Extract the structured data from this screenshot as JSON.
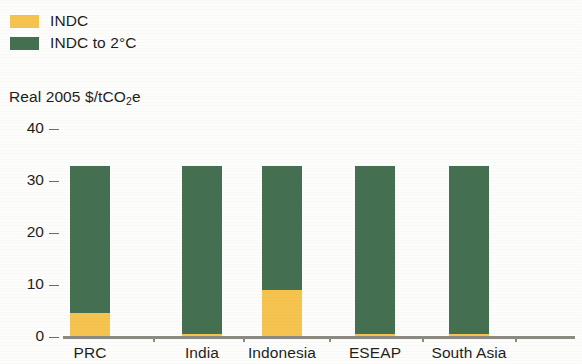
{
  "legend": {
    "items": [
      {
        "label": "INDC",
        "color": "#f6c44e",
        "swatch_name": "legend-swatch-indc"
      },
      {
        "label": "INDC to 2°C",
        "color": "#446f50",
        "swatch_name": "legend-swatch-indc-2c"
      }
    ]
  },
  "axis": {
    "y_title_main": "Real 2005 $/tCO",
    "y_title_sub": "2",
    "y_title_tail": "e",
    "y_ticks": [
      "40",
      "30",
      "20",
      "10",
      "0"
    ]
  },
  "chart_data": {
    "type": "bar",
    "stacked": true,
    "title": "",
    "subtitle": "",
    "xlabel": "",
    "ylabel": "Real 2005 $/tCO2e",
    "ylim": [
      0,
      40
    ],
    "yticks": [
      0,
      10,
      20,
      30,
      40
    ],
    "grid": false,
    "legend_position": "top-left",
    "categories": [
      "PRC",
      "India",
      "Indonesia",
      "ESEAP",
      "South Asia"
    ],
    "series": [
      {
        "name": "INDC",
        "color": "#f6c44e",
        "values": [
          4.4,
          0.3,
          8.8,
          0.3,
          0.3
        ]
      },
      {
        "name": "INDC to 2°C",
        "color": "#446f50",
        "values": [
          28.3,
          32.4,
          23.9,
          32.4,
          32.4
        ]
      }
    ],
    "totals": [
      32.7,
      32.7,
      32.7,
      32.7,
      32.7
    ],
    "units": "Real 2005 $/tCO2e"
  }
}
